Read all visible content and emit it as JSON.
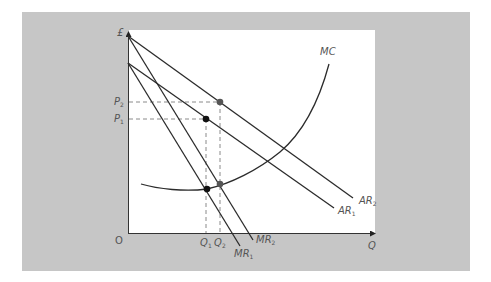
{
  "diagram": {
    "type": "economics-monopoly-cost-revenue",
    "axes": {
      "y_label": "£",
      "x_label": "Q",
      "origin_label": "O"
    },
    "curves": {
      "mc": {
        "label": "MC"
      },
      "ar1": {
        "label": "AR",
        "sub": "1"
      },
      "ar2": {
        "label": "AR",
        "sub": "2"
      },
      "mr1": {
        "label": "MR",
        "sub": "1"
      },
      "mr2": {
        "label": "MR",
        "sub": "2"
      }
    },
    "price_levels": [
      {
        "label": "P",
        "sub": "2"
      },
      {
        "label": "P",
        "sub": "1"
      }
    ],
    "quantity_levels": [
      {
        "label": "Q",
        "sub": "1"
      },
      {
        "label": "Q",
        "sub": "2"
      }
    ],
    "colors": {
      "panel": "#c6c6c6",
      "plot": "#ffffff",
      "line": "#2b2b2b",
      "dashed": "#8a8a8a",
      "dot_black": "#111111",
      "dot_grey": "#555555",
      "label": "#555555"
    }
  }
}
